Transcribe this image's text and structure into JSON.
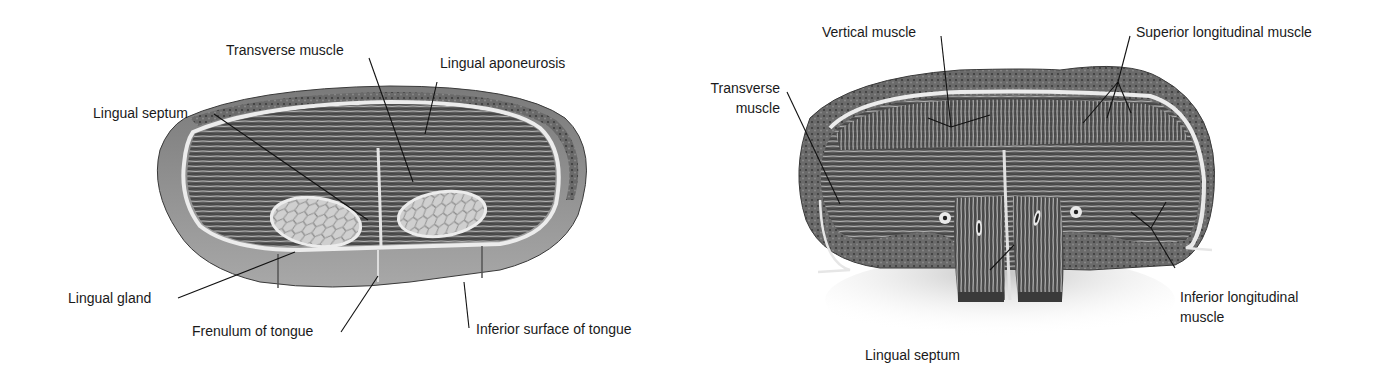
{
  "figure": {
    "panels": [
      {
        "id": "left",
        "description": "Coronal section of tongue (anterior part)",
        "labels": [
          {
            "key": "transverse_muscle",
            "text": "Transverse muscle"
          },
          {
            "key": "lingual_aponeurosis",
            "text": "Lingual aponeurosis"
          },
          {
            "key": "lingual_septum",
            "text": "Lingual septum"
          },
          {
            "key": "lingual_gland",
            "text": "Lingual gland"
          },
          {
            "key": "frenulum",
            "text": "Frenulum of tongue"
          },
          {
            "key": "inferior_surface",
            "text": "Inferior surface of tongue"
          }
        ]
      },
      {
        "id": "right",
        "description": "Coronal section of tongue (posterior part)",
        "labels": [
          {
            "key": "vertical_muscle",
            "text": "Vertical muscle"
          },
          {
            "key": "superior_longitudinal",
            "text": "Superior longitudinal muscle"
          },
          {
            "key": "transverse_muscle_l1",
            "text": "Transverse"
          },
          {
            "key": "transverse_muscle_l2",
            "text": "muscle"
          },
          {
            "key": "inferior_longitudinal_l1",
            "text": "Inferior longitudinal"
          },
          {
            "key": "inferior_longitudinal_l2",
            "text": "muscle"
          },
          {
            "key": "lingual_septum",
            "text": "Lingual septum"
          }
        ]
      }
    ],
    "colors": {
      "background": "#ffffff",
      "outer_tissue": "#6e6e6e",
      "muscle": "#5a5a5a",
      "fascia": "#e8e8e8",
      "gland": "#c9c9c9",
      "label_text": "#1a1a1a",
      "leader_line": "#111111"
    }
  }
}
